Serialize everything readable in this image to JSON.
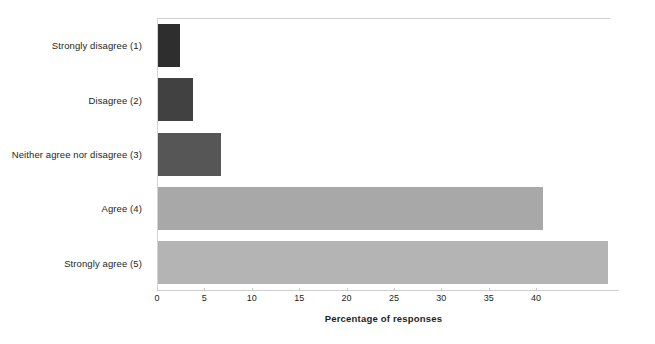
{
  "chart_data": {
    "type": "bar",
    "orientation": "horizontal",
    "title": "",
    "xlabel": "Percentage of responses",
    "ylabel": "",
    "categories": [
      "Strongly disagree (1)",
      "Disagree (2)",
      "Neither agree nor disagree (3)",
      "Agree (4)",
      "Strongly agree (5)"
    ],
    "values": [
      2.3,
      3.7,
      6.6,
      40.6,
      47.5
    ],
    "bar_colors": [
      "#2e2e2e",
      "#414141",
      "#565656",
      "#a8a8a8",
      "#b4b4b4"
    ],
    "xlim": [
      0,
      47.8
    ],
    "xticks": [
      0,
      5,
      10,
      15,
      20,
      25,
      30,
      35,
      40
    ],
    "xtick_labels": [
      "0",
      "5",
      "10",
      "15",
      "20",
      "25",
      "30",
      "35",
      "40"
    ],
    "grid": false,
    "legend": "none"
  }
}
